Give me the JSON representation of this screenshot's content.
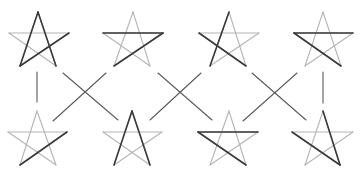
{
  "diagram": {
    "colors": {
      "light_stroke": "#b4b4b4",
      "dark_stroke": "#3a3a3a",
      "connector": "#5a5a5a",
      "background": "#ffffff"
    },
    "stars": [
      {
        "id": "top-1",
        "top": [
          38,
          12
        ],
        "left": [
          9,
          33
        ],
        "right": [
          69,
          33
        ],
        "bl": [
          20,
          66
        ],
        "br": [
          56,
          66
        ],
        "dark": [
          [
            "top",
            "bl"
          ],
          [
            "top",
            "br"
          ],
          [
            "bl",
            "right"
          ]
        ]
      },
      {
        "id": "top-2",
        "top": [
          133,
          12
        ],
        "left": [
          103,
          33
        ],
        "right": [
          163,
          33
        ],
        "bl": [
          114,
          66
        ],
        "br": [
          150,
          66
        ],
        "dark": [
          [
            "left",
            "right"
          ],
          [
            "right",
            "bl"
          ]
        ]
      },
      {
        "id": "top-3",
        "top": [
          229,
          12
        ],
        "left": [
          199,
          33
        ],
        "right": [
          259,
          33
        ],
        "bl": [
          210,
          66
        ],
        "br": [
          246,
          66
        ],
        "dark": [
          [
            "top",
            "bl"
          ],
          [
            "left",
            "br"
          ]
        ]
      },
      {
        "id": "top-4",
        "top": [
          323,
          12
        ],
        "left": [
          294,
          33
        ],
        "right": [
          353,
          33
        ],
        "bl": [
          305,
          66
        ],
        "br": [
          341,
          66
        ],
        "dark": [
          [
            "left",
            "right"
          ],
          [
            "left",
            "br"
          ]
        ]
      },
      {
        "id": "bottom-1",
        "top": [
          37,
          111
        ],
        "left": [
          8,
          132
        ],
        "right": [
          67,
          132
        ],
        "bl": [
          20,
          165
        ],
        "br": [
          56,
          165
        ],
        "dark": [
          [
            "bl",
            "right"
          ]
        ]
      },
      {
        "id": "bottom-2",
        "top": [
          132,
          111
        ],
        "left": [
          103,
          132
        ],
        "right": [
          162,
          132
        ],
        "bl": [
          114,
          165
        ],
        "br": [
          150,
          165
        ],
        "dark": [
          [
            "top",
            "bl"
          ],
          [
            "top",
            "br"
          ]
        ]
      },
      {
        "id": "bottom-3",
        "top": [
          229,
          111
        ],
        "left": [
          198,
          132
        ],
        "right": [
          258,
          132
        ],
        "bl": [
          210,
          165
        ],
        "br": [
          246,
          165
        ],
        "dark": [
          [
            "left",
            "right"
          ],
          [
            "left",
            "br"
          ]
        ]
      },
      {
        "id": "bottom-4",
        "top": [
          323,
          111
        ],
        "left": [
          292,
          132
        ],
        "right": [
          353,
          132
        ],
        "bl": [
          305,
          165
        ],
        "br": [
          340,
          165
        ],
        "dark": [
          [
            "left",
            "br"
          ],
          [
            "top",
            "br"
          ]
        ]
      }
    ],
    "connectors": [
      [
        37,
        72,
        37,
        102
      ],
      [
        63,
        73,
        118,
        120
      ],
      [
        106,
        73,
        53,
        121
      ],
      [
        158,
        73,
        212,
        120
      ],
      [
        201,
        73,
        150,
        120
      ],
      [
        252,
        73,
        306,
        120
      ],
      [
        297,
        73,
        243,
        121
      ],
      [
        323,
        72,
        323,
        103
      ]
    ]
  }
}
